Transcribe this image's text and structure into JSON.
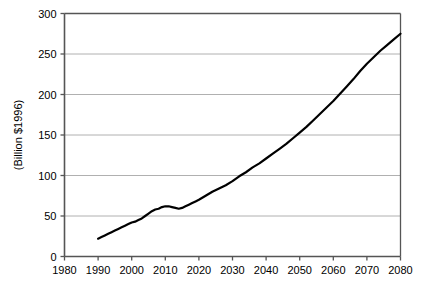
{
  "chart_data": {
    "type": "line",
    "title": "",
    "subtitle": "",
    "xlabel": "",
    "ylabel": "(Billion $1996)",
    "xlim": [
      1980,
      2080
    ],
    "ylim": [
      0,
      300
    ],
    "xticks": [
      1980,
      1990,
      2000,
      2010,
      2020,
      2030,
      2040,
      2050,
      2060,
      2070,
      2080
    ],
    "yticks": [
      0,
      50,
      100,
      150,
      200,
      250,
      300
    ],
    "xtick_labels": [
      "1980",
      "1990",
      "2000",
      "2010",
      "2020",
      "2030",
      "2040",
      "2050",
      "2060",
      "2070",
      "2080"
    ],
    "ytick_labels": [
      "0",
      "50",
      "100",
      "150",
      "200",
      "250",
      "300"
    ],
    "grid": {
      "horizontal": true,
      "vertical": false,
      "color": "#b0b0b0"
    },
    "legend": {
      "visible": false,
      "position": "none",
      "entries": []
    },
    "annotations": [],
    "series": [
      {
        "name": "projection",
        "color": "#000000",
        "line_width": 2.2,
        "x": [
          1990,
          1991,
          1992,
          1993,
          1994,
          1995,
          1996,
          1997,
          1998,
          1999,
          2000,
          2001,
          2002,
          2003,
          2004,
          2005,
          2006,
          2007,
          2008,
          2009,
          2010,
          2011,
          2012,
          2013,
          2014,
          2015,
          2016,
          2017,
          2018,
          2019,
          2020,
          2022,
          2024,
          2026,
          2028,
          2030,
          2032,
          2034,
          2036,
          2038,
          2040,
          2042,
          2044,
          2046,
          2048,
          2050,
          2052,
          2054,
          2056,
          2058,
          2060,
          2062,
          2064,
          2066,
          2068,
          2070,
          2072,
          2074,
          2076,
          2078,
          2080
        ],
        "values": [
          22,
          24,
          26,
          28,
          30,
          32,
          34,
          36,
          38,
          40,
          42,
          43,
          45,
          47,
          50,
          53,
          56,
          58,
          59,
          61,
          62,
          62,
          61,
          60,
          59,
          60,
          62,
          64,
          66,
          68,
          70,
          75,
          80,
          84,
          88,
          93,
          99,
          104,
          110,
          115,
          121,
          127,
          133,
          139,
          146,
          153,
          160,
          168,
          176,
          184,
          192,
          201,
          210,
          219,
          229,
          238,
          246,
          254,
          261,
          268,
          275
        ]
      }
    ]
  },
  "figure": {
    "background_color": "#ffffff",
    "frame_color": "#555555",
    "axis_color": "#555555",
    "line_color": "#000000",
    "grid_color": "#b0b0b0"
  }
}
